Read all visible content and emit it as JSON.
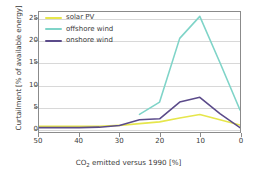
{
  "chart_data": {
    "type": "line",
    "title": "",
    "xlabel": "CO2 emitted versus 1990 [%]",
    "xlabel_parts": {
      "pre": "CO",
      "sub": "2",
      "post": " emitted versus 1990 [%]"
    },
    "ylabel": "Curtailment [% of available energy]",
    "xlim": [
      50,
      0
    ],
    "ylim": [
      -0.8,
      26.5
    ],
    "x_ticks": [
      50,
      40,
      30,
      20,
      10,
      0
    ],
    "y_ticks": [
      0,
      5,
      10,
      15,
      20,
      25
    ],
    "x_inverted": true,
    "grid": "horizontal",
    "legend_position": "upper-left",
    "series": [
      {
        "name": "solar PV",
        "color": "#e6e64b",
        "x": [
          50,
          45,
          40,
          35,
          30,
          25,
          20,
          15,
          10,
          5,
          0
        ],
        "values": [
          0.5,
          0.5,
          0.5,
          0.5,
          0.7,
          1.1,
          1.5,
          2.4,
          3.2,
          2.0,
          0.8
        ]
      },
      {
        "name": "offshore wind",
        "color": "#7fd4c8",
        "x": [
          25,
          20,
          15,
          10,
          5,
          0
        ],
        "values": [
          3.2,
          6.0,
          20.5,
          25.5,
          15.0,
          4.2
        ]
      },
      {
        "name": "onshore wind",
        "color": "#5b4b8a",
        "x": [
          50,
          45,
          40,
          35,
          30,
          25,
          20,
          15,
          10,
          5,
          0
        ],
        "values": [
          0.2,
          0.2,
          0.2,
          0.3,
          0.7,
          2.0,
          2.2,
          6.0,
          7.1,
          3.4,
          0.2
        ]
      }
    ]
  },
  "legend": {
    "items": [
      {
        "label": "solar PV"
      },
      {
        "label": "offshore wind"
      },
      {
        "label": "onshore wind"
      }
    ]
  },
  "colors": {
    "solar_pv": "#e6e64b",
    "offshore_wind": "#7fd4c8",
    "onshore_wind": "#5b4b8a",
    "axis": "#8b8b8b",
    "grid": "#d8d8d8",
    "text": "#3a3a3a",
    "background": "#ffffff"
  }
}
